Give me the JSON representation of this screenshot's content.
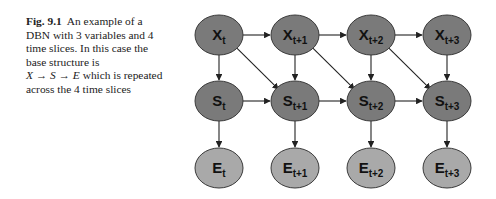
{
  "caption": {
    "figure_label": "Fig. 9.1",
    "text_part1": "An example of a DBN with 3 variables and 4 time slices. In this case the base structure is",
    "math": "X → S → E",
    "text_part2": "which is repeated across the 4 time slices"
  },
  "diagram": {
    "colors": {
      "hidden_fill": "#7a7a7a",
      "observed_fill": "#a9a9a9",
      "stroke": "#3a3a3a",
      "edge": "#222222"
    },
    "rows": [
      {
        "var": "X",
        "y": 35,
        "type": "hidden"
      },
      {
        "var": "S",
        "y": 101,
        "type": "hidden"
      },
      {
        "var": "E",
        "y": 168,
        "type": "observed"
      }
    ],
    "slices": [
      {
        "sub": "t",
        "x": 219
      },
      {
        "sub": "t+1",
        "x": 295
      },
      {
        "sub": "t+2",
        "x": 371
      },
      {
        "sub": "t+3",
        "x": 447
      }
    ]
  }
}
